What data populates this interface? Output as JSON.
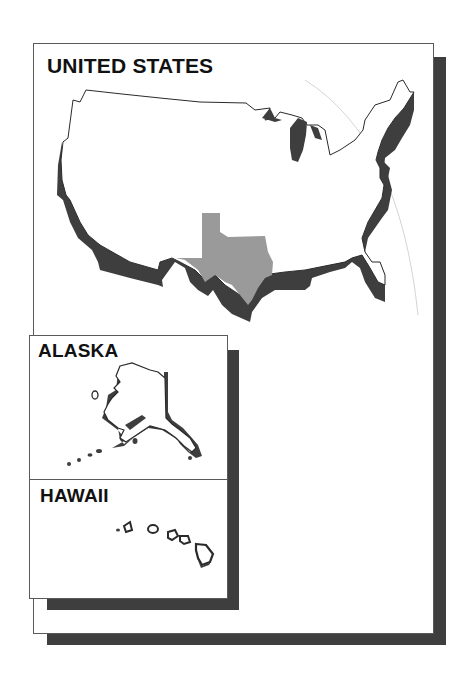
{
  "main_map": {
    "title": "UNITED STATES",
    "highlighted_state": "Texas",
    "colors": {
      "land": "#ffffff",
      "outline": "#2a2a2a",
      "shadow": "#3e3e3e",
      "highlight": "#9a9a9a",
      "frame_border": "#5a5a5a"
    }
  },
  "insets": [
    {
      "title": "ALASKA"
    },
    {
      "title": "HAWAII"
    }
  ]
}
